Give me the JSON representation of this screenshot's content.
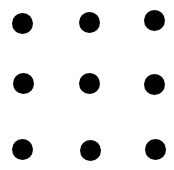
{
  "diagram": {
    "type": "dot-grid",
    "rows": 3,
    "cols": 3,
    "dot_color": "#000000",
    "background": "#ffffff",
    "dot_radius": 10.5,
    "dots": [
      {
        "row": 0,
        "col": 0,
        "cx": 22,
        "cy": 23
      },
      {
        "row": 0,
        "col": 1,
        "cx": 89,
        "cy": 22
      },
      {
        "row": 0,
        "col": 2,
        "cx": 154,
        "cy": 20
      },
      {
        "row": 1,
        "col": 0,
        "cx": 23,
        "cy": 83
      },
      {
        "row": 1,
        "col": 1,
        "cx": 89,
        "cy": 83
      },
      {
        "row": 1,
        "col": 2,
        "cx": 154,
        "cy": 84
      },
      {
        "row": 2,
        "col": 0,
        "cx": 22,
        "cy": 149
      },
      {
        "row": 2,
        "col": 1,
        "cx": 90,
        "cy": 150
      },
      {
        "row": 2,
        "col": 2,
        "cx": 155,
        "cy": 149
      }
    ]
  }
}
